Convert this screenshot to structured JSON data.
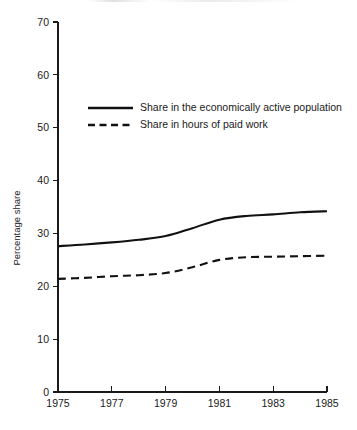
{
  "chart_data": {
    "type": "line",
    "title": "",
    "xlabel": "",
    "ylabel": "Percentage share",
    "xlim": [
      1975,
      1985
    ],
    "ylim": [
      0,
      70
    ],
    "grid": false,
    "legend_position": "upper-left-inside",
    "x": [
      1975,
      1976,
      1977,
      1978,
      1979,
      1980,
      1981,
      1982,
      1983,
      1984,
      1985
    ],
    "yticks": [
      0,
      10,
      20,
      30,
      40,
      50,
      60,
      70
    ],
    "ytick_labels": [
      "0",
      "10",
      "20",
      "30",
      "40",
      "50",
      "60",
      "70"
    ],
    "xticks": [
      1975,
      1977,
      1979,
      1981,
      1983,
      1985
    ],
    "xtick_labels": [
      "1975",
      "1977",
      "1979",
      "1981",
      "1983",
      "1985"
    ],
    "series": [
      {
        "name": "Share in the economically active population",
        "style": "solid",
        "color": "#111111",
        "values": [
          27.6,
          27.9,
          28.3,
          28.8,
          29.5,
          31.0,
          32.6,
          33.3,
          33.6,
          34.0,
          34.2
        ]
      },
      {
        "name": "Share in hours of paid work",
        "style": "dashed",
        "color": "#111111",
        "values": [
          21.4,
          21.6,
          21.9,
          22.1,
          22.5,
          23.6,
          25.0,
          25.5,
          25.6,
          25.7,
          25.8
        ]
      }
    ]
  },
  "legend": {
    "items": [
      {
        "label": "Share in the economically active population",
        "style": "solid"
      },
      {
        "label": "Share in hours of paid work",
        "style": "dashed"
      }
    ]
  },
  "axes": {
    "y_title": "Percentage share"
  }
}
